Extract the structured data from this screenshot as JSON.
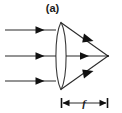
{
  "figure": {
    "panel_label": "(a)",
    "caption_present": false,
    "background_color": "#ffffff",
    "stroke_color": "#1a1a1a",
    "width_px": 122,
    "height_px": 113
  },
  "diagram": {
    "type": "ray-optics-converging-lens",
    "lens": {
      "name": "biconvex-lens",
      "center_x": 61,
      "top_y": 22,
      "bottom_y": 90,
      "left_edge_x": 54,
      "right_edge_x": 68
    },
    "optical_axis": {
      "y": 56,
      "x_start": 5,
      "x_end": 108
    },
    "focal_point": {
      "x": 108,
      "y": 56
    },
    "incoming_rays": [
      {
        "label": "upper-parallel-ray",
        "y": 30,
        "x_start": 5,
        "x_end": 55,
        "arrow_x": 40
      },
      {
        "label": "axial-parallel-ray",
        "y": 56,
        "x_start": 5,
        "x_end": 55,
        "arrow_x": 40
      },
      {
        "label": "lower-parallel-ray",
        "y": 81,
        "x_start": 5,
        "x_end": 55,
        "arrow_x": 40
      }
    ],
    "refracted_rays": [
      {
        "label": "upper-converging-ray",
        "from_x": 62,
        "from_y": 24,
        "to_x": 108,
        "to_y": 56,
        "arrow_t": 0.62
      },
      {
        "label": "axial-ray",
        "from_x": 68,
        "from_y": 56,
        "to_x": 108,
        "to_y": 56,
        "arrow_t": 0.42
      },
      {
        "label": "lower-converging-ray",
        "from_x": 62,
        "from_y": 88,
        "to_x": 108,
        "to_y": 56,
        "arrow_t": 0.62
      }
    ],
    "dimension": {
      "name": "focal-length-dimension",
      "symbol": "f",
      "y": 103,
      "x_start": 61,
      "x_end": 108,
      "tick_half_height": 5,
      "label_x": 84,
      "label_y": 106
    }
  }
}
